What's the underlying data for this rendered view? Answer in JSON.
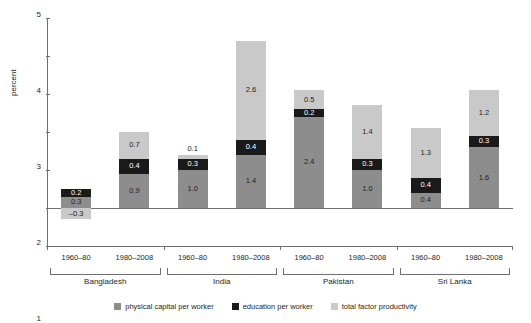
{
  "chart_data": {
    "type": "bar",
    "stacked": true,
    "title": "",
    "xlabel": "",
    "ylabel": "percent",
    "ylim": [
      -1,
      5
    ],
    "yticks": [
      -1,
      0,
      1,
      2,
      3,
      4,
      5
    ],
    "ytick_labels": [
      "–1",
      "0",
      "1",
      "2",
      "3",
      "4",
      "5"
    ],
    "grid": false,
    "legend_position": "bottom",
    "categories": [
      "1960–80",
      "1980–2008",
      "1960–80",
      "1980–2008",
      "1960–80",
      "1980–2008",
      "1960–80",
      "1980–2008"
    ],
    "groups": [
      {
        "name": "Bangladesh",
        "periods": [
          "1960–80",
          "1980–2008"
        ]
      },
      {
        "name": "India",
        "periods": [
          "1960–80",
          "1980–2008"
        ]
      },
      {
        "name": "Pakistan",
        "periods": [
          "1960–80",
          "1980–2008"
        ]
      },
      {
        "name": "Sri Lanka",
        "periods": [
          "1960–80",
          "1980–2008"
        ]
      }
    ],
    "series": [
      {
        "name": "physical capital per worker",
        "color": "#8d8d8d",
        "values": [
          0.3,
          0.9,
          1.0,
          1.4,
          2.4,
          1.0,
          0.4,
          1.6
        ]
      },
      {
        "name": "education per worker",
        "color": "#1a1a1a",
        "values": [
          0.2,
          0.4,
          0.3,
          0.4,
          0.2,
          0.3,
          0.4,
          0.3
        ]
      },
      {
        "name": "total factor productivity",
        "color": "#c9c9c9",
        "values": [
          -0.3,
          0.7,
          0.1,
          2.6,
          0.5,
          1.4,
          1.3,
          1.2
        ]
      }
    ],
    "bars": [
      {
        "group": "Bangladesh",
        "period": "1960–80",
        "total": 0.2,
        "segments": [
          {
            "series": "physical capital per worker",
            "value": 0.3,
            "label": "0.3",
            "label_color": "dark-bg-light-text",
            "from": 0.0,
            "to": 0.3
          },
          {
            "series": "education per worker",
            "value": 0.2,
            "label": "0.2",
            "label_color": "light",
            "from": 0.3,
            "to": 0.5
          },
          {
            "series": "total factor productivity",
            "value": -0.3,
            "label": "–0.3",
            "label_color": "dark",
            "from": -0.3,
            "to": 0.0
          }
        ]
      },
      {
        "group": "Bangladesh",
        "period": "1980–2008",
        "total": 2.0,
        "segments": [
          {
            "series": "physical capital per worker",
            "value": 0.9,
            "label": "0.9",
            "label_color": "dark",
            "from": 0.0,
            "to": 0.9
          },
          {
            "series": "education per worker",
            "value": 0.4,
            "label": "0.4",
            "label_color": "light",
            "from": 0.9,
            "to": 1.3
          },
          {
            "series": "total factor productivity",
            "value": 0.7,
            "label": "0.7",
            "label_color": "dark",
            "from": 1.3,
            "to": 2.0
          }
        ]
      },
      {
        "group": "India",
        "period": "1960–80",
        "total": 1.4,
        "segments": [
          {
            "series": "physical capital per worker",
            "value": 1.0,
            "label": "1.0",
            "label_color": "dark",
            "from": 0.0,
            "to": 1.0
          },
          {
            "series": "education per worker",
            "value": 0.3,
            "label": "0.3",
            "label_color": "light",
            "from": 1.0,
            "to": 1.3
          },
          {
            "series": "total factor productivity",
            "value": 0.1,
            "label": "0.1",
            "label_color": "outside",
            "from": 1.3,
            "to": 1.4
          }
        ]
      },
      {
        "group": "India",
        "period": "1980–2008",
        "total": 4.4,
        "segments": [
          {
            "series": "physical capital per worker",
            "value": 1.4,
            "label": "1.4",
            "label_color": "dark",
            "from": 0.0,
            "to": 1.4
          },
          {
            "series": "education per worker",
            "value": 0.4,
            "label": "0.4",
            "label_color": "light",
            "from": 1.4,
            "to": 1.8
          },
          {
            "series": "total factor productivity",
            "value": 2.6,
            "label": "2.6",
            "label_color": "dark",
            "from": 1.8,
            "to": 4.4
          }
        ]
      },
      {
        "group": "Pakistan",
        "period": "1960–80",
        "total": 3.1,
        "segments": [
          {
            "series": "physical capital per worker",
            "value": 2.4,
            "label": "2.4",
            "label_color": "dark",
            "from": 0.0,
            "to": 2.4
          },
          {
            "series": "education per worker",
            "value": 0.2,
            "label": "0.2",
            "label_color": "light",
            "from": 2.4,
            "to": 2.6
          },
          {
            "series": "total factor productivity",
            "value": 0.5,
            "label": "0.5",
            "label_color": "dark",
            "from": 2.6,
            "to": 3.1
          }
        ]
      },
      {
        "group": "Pakistan",
        "period": "1980–2008",
        "total": 2.7,
        "segments": [
          {
            "series": "physical capital per worker",
            "value": 1.0,
            "label": "1.0",
            "label_color": "dark",
            "from": 0.0,
            "to": 1.0
          },
          {
            "series": "education per worker",
            "value": 0.3,
            "label": "0.3",
            "label_color": "light",
            "from": 1.0,
            "to": 1.3
          },
          {
            "series": "total factor productivity",
            "value": 1.4,
            "label": "1.4",
            "label_color": "dark",
            "from": 1.3,
            "to": 2.7
          }
        ]
      },
      {
        "group": "Sri Lanka",
        "period": "1960–80",
        "total": 2.1,
        "segments": [
          {
            "series": "physical capital per worker",
            "value": 0.4,
            "label": "0.4",
            "label_color": "dark",
            "from": 0.0,
            "to": 0.4
          },
          {
            "series": "education per worker",
            "value": 0.4,
            "label": "0.4",
            "label_color": "light",
            "from": 0.4,
            "to": 0.8
          },
          {
            "series": "total factor productivity",
            "value": 1.3,
            "label": "1.3",
            "label_color": "dark",
            "from": 0.8,
            "to": 2.1
          }
        ]
      },
      {
        "group": "Sri Lanka",
        "period": "1980–2008",
        "total": 3.1,
        "segments": [
          {
            "series": "physical capital per worker",
            "value": 1.6,
            "label": "1.6",
            "label_color": "dark",
            "from": 0.0,
            "to": 1.6
          },
          {
            "series": "education per worker",
            "value": 0.3,
            "label": "0.3",
            "label_color": "light",
            "from": 1.6,
            "to": 1.9
          },
          {
            "series": "total factor productivity",
            "value": 1.2,
            "label": "1.2",
            "label_color": "dark",
            "from": 1.9,
            "to": 3.1
          }
        ]
      }
    ],
    "legend": [
      {
        "label": "physical capital per worker",
        "color": "#8d8d8d"
      },
      {
        "label": "education per worker",
        "color": "#1a1a1a"
      },
      {
        "label": "total factor productivity",
        "color": "#c9c9c9"
      }
    ]
  }
}
